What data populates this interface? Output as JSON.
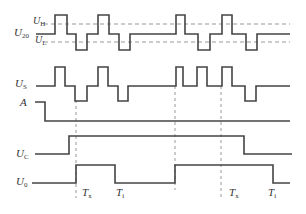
{
  "diagram": {
    "type": "timing-diagram",
    "colors": {
      "wave": "#444444",
      "dashed": "#999999",
      "text": "#333333"
    },
    "labels": {
      "u20": {
        "main": "U",
        "sub": "20"
      },
      "uh": {
        "main": "U",
        "sub": "H"
      },
      "ul": {
        "main": "U",
        "sub": "L"
      },
      "us": {
        "main": "U",
        "sub": "S"
      },
      "a": {
        "main": "A",
        "sub": ""
      },
      "uc": {
        "main": "U",
        "sub": "C"
      },
      "u0": {
        "main": "U",
        "sub": "0"
      },
      "tx1": {
        "main": "T",
        "sub": "x"
      },
      "ti1": {
        "main": "T",
        "sub": "i"
      },
      "tx2": {
        "main": "T",
        "sub": "x"
      },
      "ti2": {
        "main": "T",
        "sub": "i"
      }
    },
    "signals": [
      {
        "name": "U20",
        "points": "36,34 55,34 55,15 67,15 67,34 76,34 76,50 87,50 87,34 98,34 98,15 109,15 109,34 119,34 119,50 130,50 130,34 176,34 176,15 185,15 185,34 198,34 198,50 210,50 210,34 222,34 222,15 232,15 232,34 246,34 246,50 257,50 257,34 290,34"
      },
      {
        "name": "US",
        "points": "36,86 55,86 55,67 65,67 65,86 75,86 75,101 87,101 87,86 98,86 98,67 108,67 108,86 118,86 118,101 128,101 128,86 176,86 176,67 183,67 183,86 197,86 197,67 207,67 207,86 222,86 222,67 232,67 232,86 245,86 245,101 256,101 256,86 290,86"
      },
      {
        "name": "A",
        "points": "35,102 45,102 45,121 290,121"
      },
      {
        "name": "UC",
        "points": "35,154 69,154 69,136 244,136 244,154 292,154"
      },
      {
        "name": "U0",
        "points": "32,183 76,183 76,165 115,165 115,183 175,183 175,165 273,165 273,183 290,183"
      }
    ],
    "thresholds": [
      {
        "name": "UH",
        "y": 24,
        "x1": 44,
        "x2": 290
      },
      {
        "name": "UL",
        "y": 42,
        "x1": 44,
        "x2": 290
      }
    ],
    "markers": [
      {
        "name": "marker-1",
        "x": 76,
        "y1": 100,
        "y2": 198
      },
      {
        "name": "marker-2",
        "x": 175,
        "y1": 86,
        "y2": 190
      },
      {
        "name": "marker-3",
        "x": 221,
        "y1": 86,
        "y2": 198
      }
    ]
  }
}
